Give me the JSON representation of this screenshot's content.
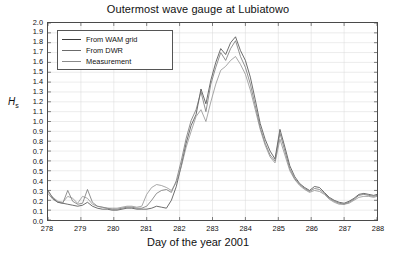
{
  "figure": {
    "title": "Outermost wave gauge at Lubiatowo",
    "x_axis_title": "Day of the year 2001",
    "y_axis_title": "H",
    "y_axis_subscript": "s"
  },
  "legend": {
    "position": "top-left",
    "items": [
      {
        "label": "From WAM grid",
        "color": "#3c3c3c",
        "name": "legend-wam-grid"
      },
      {
        "label": "From DWR",
        "color": "#6b6b6b",
        "name": "legend-dwr"
      },
      {
        "label": "Measurement",
        "color": "#8a8a8a",
        "name": "legend-measurement"
      }
    ]
  },
  "colors": {
    "frame": "#4a4a4a",
    "grid": "#d8d8d8",
    "background": "#ffffff",
    "text": "#111111"
  },
  "chart_data": {
    "type": "line",
    "title": "Outermost wave gauge at Lubiatowo",
    "xlabel": "Day of the year 2001",
    "ylabel": "Hs",
    "xlim": [
      278,
      288
    ],
    "ylim": [
      0.0,
      2.0
    ],
    "grid": true,
    "legend_position": "top-left",
    "xticks": [
      278,
      279,
      280,
      281,
      282,
      283,
      284,
      285,
      286,
      287,
      288
    ],
    "xticklabels": [
      "278",
      "279",
      "280",
      "281",
      "282",
      "283",
      "284",
      "285",
      "286",
      "287",
      "288"
    ],
    "yticks": [
      0.0,
      0.1,
      0.2,
      0.3,
      0.4,
      0.5,
      0.6,
      0.7,
      0.8,
      0.9,
      1.0,
      1.1,
      1.2,
      1.3,
      1.4,
      1.5,
      1.6,
      1.7,
      1.8,
      1.9,
      2.0
    ],
    "yticklabels": [
      "0.0",
      "0.1",
      "0.2",
      "0.3",
      "0.4",
      "0.5",
      "0.6",
      "0.7",
      "0.8",
      "0.9",
      "1.0",
      "1.1",
      "1.2",
      "1.3",
      "1.4",
      "1.5",
      "1.6",
      "1.7",
      "1.8",
      "1.9",
      "2.0"
    ],
    "x": [
      278.0,
      278.15,
      278.3,
      278.45,
      278.6,
      278.75,
      278.9,
      279.05,
      279.2,
      279.35,
      279.5,
      279.65,
      279.8,
      279.95,
      280.1,
      280.25,
      280.4,
      280.55,
      280.7,
      280.85,
      281.0,
      281.15,
      281.3,
      281.45,
      281.6,
      281.75,
      281.9,
      282.05,
      282.2,
      282.35,
      282.5,
      282.65,
      282.8,
      282.95,
      283.1,
      283.25,
      283.4,
      283.55,
      283.7,
      283.85,
      284.0,
      284.15,
      284.3,
      284.45,
      284.6,
      284.75,
      284.9,
      285.05,
      285.2,
      285.35,
      285.5,
      285.65,
      285.8,
      285.95,
      286.1,
      286.25,
      286.4,
      286.55,
      286.7,
      286.85,
      287.0,
      287.15,
      287.3,
      287.45,
      287.6,
      287.75,
      287.9,
      288.0
    ],
    "series": [
      {
        "name": "From WAM grid",
        "color": "#3c3c3c",
        "values": [
          0.3,
          0.22,
          0.18,
          0.17,
          0.16,
          0.15,
          0.14,
          0.15,
          0.18,
          0.14,
          0.12,
          0.11,
          0.11,
          0.1,
          0.1,
          0.11,
          0.12,
          0.12,
          0.11,
          0.11,
          0.11,
          0.12,
          0.14,
          0.13,
          0.12,
          0.2,
          0.34,
          0.55,
          0.78,
          0.96,
          1.07,
          1.33,
          1.18,
          1.42,
          1.6,
          1.74,
          1.68,
          1.8,
          1.86,
          1.72,
          1.62,
          1.45,
          1.22,
          0.98,
          0.82,
          0.7,
          0.62,
          0.92,
          0.74,
          0.55,
          0.44,
          0.37,
          0.33,
          0.3,
          0.34,
          0.33,
          0.28,
          0.23,
          0.2,
          0.18,
          0.17,
          0.19,
          0.22,
          0.26,
          0.27,
          0.26,
          0.25,
          0.26
        ]
      },
      {
        "name": "From DWR",
        "color": "#6b6b6b",
        "values": [
          0.27,
          0.21,
          0.18,
          0.17,
          0.3,
          0.19,
          0.16,
          0.17,
          0.31,
          0.18,
          0.14,
          0.13,
          0.12,
          0.11,
          0.11,
          0.12,
          0.13,
          0.13,
          0.12,
          0.12,
          0.14,
          0.2,
          0.27,
          0.3,
          0.31,
          0.28,
          0.4,
          0.6,
          0.83,
          1.01,
          1.12,
          1.3,
          1.1,
          1.38,
          1.55,
          1.7,
          1.62,
          1.74,
          1.82,
          1.66,
          1.55,
          1.38,
          1.16,
          0.94,
          0.78,
          0.66,
          0.6,
          0.88,
          0.7,
          0.52,
          0.42,
          0.36,
          0.32,
          0.29,
          0.32,
          0.31,
          0.27,
          0.22,
          0.19,
          0.17,
          0.16,
          0.18,
          0.21,
          0.25,
          0.26,
          0.25,
          0.24,
          0.25
        ]
      },
      {
        "name": "Measurement",
        "color": "#8a8a8a",
        "values": [
          0.29,
          0.23,
          0.19,
          0.18,
          0.24,
          0.22,
          0.17,
          0.24,
          0.22,
          0.16,
          0.14,
          0.13,
          0.12,
          0.12,
          0.12,
          0.13,
          0.14,
          0.14,
          0.13,
          0.14,
          0.26,
          0.33,
          0.36,
          0.35,
          0.33,
          0.3,
          0.38,
          0.54,
          0.74,
          0.9,
          1.05,
          1.12,
          1.0,
          1.2,
          1.38,
          1.52,
          1.56,
          1.62,
          1.66,
          1.58,
          1.48,
          1.32,
          1.12,
          0.92,
          0.76,
          0.64,
          0.58,
          0.82,
          0.66,
          0.5,
          0.41,
          0.35,
          0.31,
          0.28,
          0.3,
          0.29,
          0.26,
          0.21,
          0.18,
          0.16,
          0.16,
          0.17,
          0.2,
          0.23,
          0.24,
          0.24,
          0.23,
          0.24
        ]
      }
    ]
  }
}
